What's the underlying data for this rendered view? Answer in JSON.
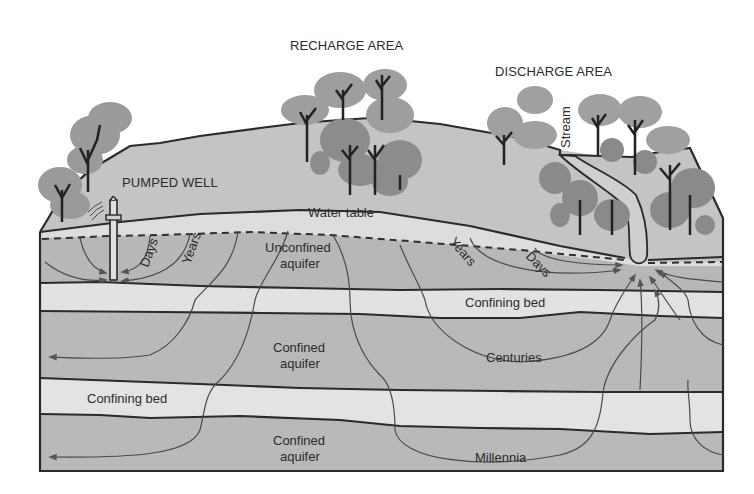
{
  "figure": {
    "area_labels": {
      "recharge": "RECHARGE AREA",
      "discharge": "DISCHARGE AREA",
      "pumped_well": "PUMPED WELL",
      "stream": "Stream"
    },
    "layer_labels": {
      "water_table": "Water table",
      "unconfined_1": "Unconfined",
      "unconfined_2": "aquifer",
      "confining_bed_upper": "Confining bed",
      "confined_upper_1": "Confined",
      "confined_upper_2": "aquifer",
      "confining_bed_lower": "Confining bed",
      "confined_lower_1": "Confined",
      "confined_lower_2": "aquifer"
    },
    "travel_times": {
      "well_days": "Days",
      "well_years": "Years",
      "stream_years": "Years",
      "stream_days": "Days",
      "centuries": "Centuries",
      "millennia": "Millennia"
    },
    "colors": {
      "aquifer": "#b9b9b9",
      "confining_bed": "#e2e2e2",
      "unsaturated": "#c4c4c4",
      "tree_light": "#9c9c9c",
      "tree_dark": "#8a8a8a",
      "line": "#2a2a2a"
    }
  }
}
